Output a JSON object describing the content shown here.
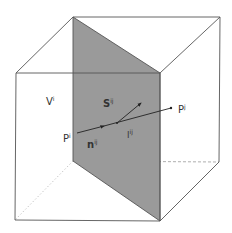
{
  "diagram": {
    "colors": {
      "edge": "#555555",
      "plane_fill": "#9a9a9a",
      "plane_edge": "#555555",
      "arrow": "#222222",
      "hidden_edge": "#aaaaaa",
      "label": "#333333"
    },
    "labels": {
      "volume": {
        "base": "V",
        "sup": "i"
      },
      "face": {
        "base": "S",
        "sup": "ij"
      },
      "point_i": {
        "base": "P",
        "sup": "i"
      },
      "point_j": {
        "base": "P",
        "sup": "j"
      },
      "normal": {
        "base": "n",
        "sup": "ij"
      },
      "distance": {
        "base": "l",
        "sup": "ij"
      }
    }
  }
}
